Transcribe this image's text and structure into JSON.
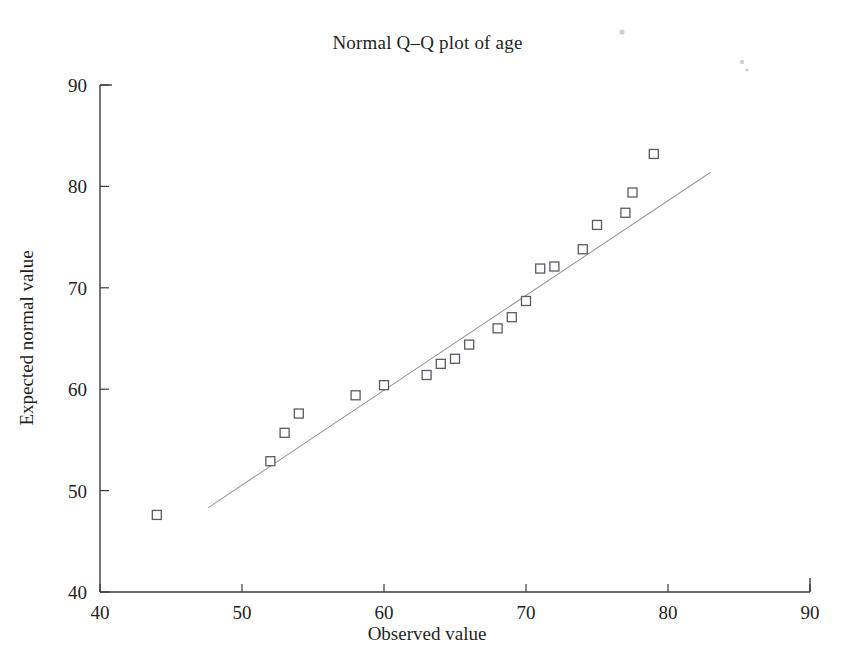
{
  "chart_data": {
    "type": "scatter",
    "title": "Normal Q–Q plot of age",
    "xlabel": "Observed value",
    "ylabel": "Expected normal value",
    "xlim": [
      40,
      90
    ],
    "ylim": [
      40,
      90
    ],
    "xticks": [
      40,
      50,
      60,
      70,
      80,
      90
    ],
    "yticks": [
      40,
      50,
      60,
      70,
      80,
      90
    ],
    "xtick_labels": [
      "40",
      "50",
      "60",
      "70",
      "80",
      "90"
    ],
    "ytick_labels": [
      "40",
      "50",
      "60",
      "70",
      "80",
      "90"
    ],
    "grid": false,
    "legend": false,
    "series": [
      {
        "name": "Age quantiles",
        "marker": "open-square",
        "x": [
          44.0,
          52.0,
          53.0,
          54.0,
          58.0,
          60.0,
          63.0,
          64.0,
          65.0,
          66.0,
          68.0,
          69.0,
          70.0,
          71.0,
          72.0,
          74.0,
          75.0,
          77.0,
          77.5,
          79.0
        ],
        "y": [
          47.6,
          52.9,
          55.7,
          57.6,
          59.4,
          60.4,
          61.4,
          62.5,
          63.0,
          64.4,
          66.0,
          67.1,
          68.7,
          71.9,
          72.1,
          73.8,
          76.2,
          77.4,
          79.4,
          83.2
        ]
      }
    ],
    "reference_line": {
      "name": "normal reference line",
      "x": [
        47.6,
        83.0
      ],
      "y": [
        48.3,
        81.4
      ],
      "style": "thin-grey-solid"
    }
  },
  "figure": {
    "background_color": "#ffffff",
    "axis_color": "#3a3a3a",
    "marker_color": "#5a5a64",
    "reference_line_color": "#9b9b9b"
  },
  "artifacts": {
    "specks": [
      {
        "x": 622,
        "y": 32,
        "r": 2.6
      },
      {
        "x": 742,
        "y": 62,
        "r": 2.2
      },
      {
        "x": 747,
        "y": 70,
        "r": 1.6
      }
    ]
  }
}
